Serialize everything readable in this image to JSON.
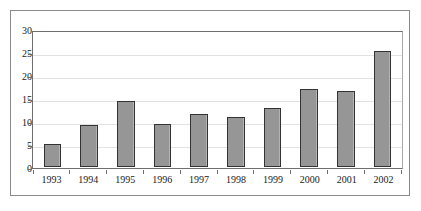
{
  "chart_data": {
    "type": "bar",
    "title": "",
    "subtitle": "",
    "xlabel": "",
    "ylabel": "",
    "categories": [
      "1993",
      "1994",
      "1995",
      "1996",
      "1997",
      "1998",
      "1999",
      "2000",
      "2001",
      "2002"
    ],
    "values": [
      5.0,
      9.3,
      14.5,
      9.4,
      11.7,
      11.0,
      13.1,
      17.2,
      16.7,
      25.5
    ],
    "ylim": [
      0,
      30
    ],
    "ytick_labels": [
      "0",
      "5",
      "10",
      "15",
      "20",
      "25",
      "30"
    ],
    "ytick_values": [
      0,
      5,
      10,
      15,
      20,
      25,
      30
    ],
    "grid": true,
    "grid_axis": "y",
    "legend": false,
    "legend_position": "none",
    "colors": {
      "bar_fill": "#969696",
      "bar_border": "#333333",
      "gridline": "#e2e2e2",
      "axis_line": "#6e6e6e",
      "frame_border": "#8a8a8a",
      "text": "#1a1a1a",
      "background": "#ffffff"
    }
  }
}
